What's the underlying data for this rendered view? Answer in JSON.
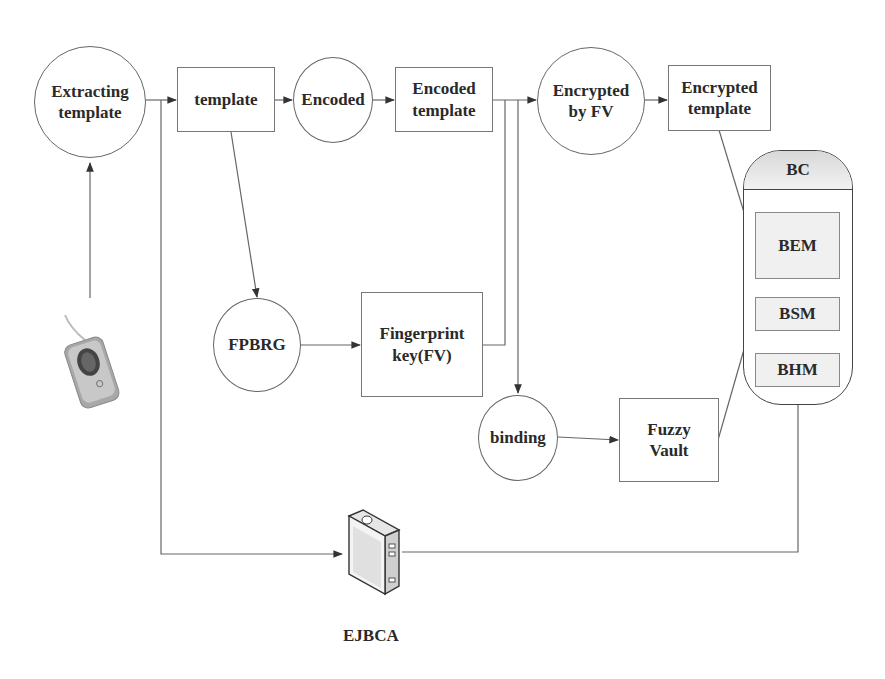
{
  "diagram": {
    "nodes": {
      "extracting_template": "Extracting\ntemplate",
      "template": "template",
      "encoded": "Encoded",
      "encoded_template": "Encoded\ntemplate",
      "encrypted_by_fv": "Encrypted\nby FV",
      "encrypted_template": "Encrypted\ntemplate",
      "fpbrg": "FPBRG",
      "fingerprint_key": "Fingerprint\nkey(FV)",
      "binding": "binding",
      "fuzzy_vault": "Fuzzy\nVault",
      "ejbca": "EJBCA"
    },
    "bc": {
      "title": "BC",
      "modules": [
        "BEM",
        "BSM",
        "BHM"
      ]
    },
    "icons": {
      "scanner": "fingerprint-scanner-icon",
      "server": "server-icon"
    },
    "edges": [
      {
        "from": "fingerprint_scanner",
        "to": "extracting_template"
      },
      {
        "from": "extracting_template",
        "to": "template"
      },
      {
        "from": "template",
        "to": "encoded"
      },
      {
        "from": "encoded",
        "to": "encoded_template"
      },
      {
        "from": "encoded_template",
        "to": "encrypted_by_fv"
      },
      {
        "from": "encrypted_by_fv",
        "to": "encrypted_template"
      },
      {
        "from": "template",
        "to": "fpbrg"
      },
      {
        "from": "fpbrg",
        "to": "fingerprint_key"
      },
      {
        "from": "fingerprint_key",
        "to": "encrypted_by_fv"
      },
      {
        "from": "encoded_template",
        "to": "binding"
      },
      {
        "from": "binding",
        "to": "fuzzy_vault"
      },
      {
        "from": "encrypted_template",
        "to": "BEM"
      },
      {
        "from": "fuzzy_vault",
        "to": "BSM"
      },
      {
        "from": "extracting_template",
        "to": "ejbca"
      },
      {
        "from": "ejbca",
        "to": "BHM"
      }
    ],
    "colors": {
      "line": "#555555",
      "text": "#2a2a2a",
      "bc_module_fill": "#f0f0f0"
    }
  }
}
